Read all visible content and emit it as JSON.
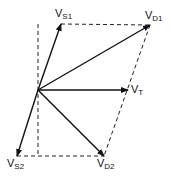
{
  "diagram": {
    "type": "phasor-vector-diagram",
    "origin": {
      "x": 38,
      "y": 90
    },
    "vectors": [
      {
        "id": "vs1",
        "label_main": "V",
        "label_sub": "S1",
        "to": {
          "x": 61,
          "y": 24
        }
      },
      {
        "id": "vd1",
        "label_main": "V",
        "label_sub": "D1",
        "to": {
          "x": 150,
          "y": 25
        }
      },
      {
        "id": "vt",
        "label_main": "V",
        "label_sub": "T",
        "to": {
          "x": 128,
          "y": 90
        }
      },
      {
        "id": "vs2",
        "label_main": "V",
        "label_sub": "S2",
        "to": {
          "x": 17,
          "y": 156
        }
      },
      {
        "id": "vd2",
        "label_main": "V",
        "label_sub": "D2",
        "to": {
          "x": 104,
          "y": 156
        }
      }
    ],
    "dashed_lines": [
      {
        "from": {
          "x": 61,
          "y": 24
        },
        "to": {
          "x": 150,
          "y": 25
        }
      },
      {
        "from": {
          "x": 150,
          "y": 25
        },
        "to": {
          "x": 104,
          "y": 156
        }
      },
      {
        "from": {
          "x": 17,
          "y": 156
        },
        "to": {
          "x": 104,
          "y": 156
        }
      },
      {
        "from": {
          "x": 38,
          "y": 24
        },
        "to": {
          "x": 38,
          "y": 156
        }
      }
    ],
    "colors": {
      "stroke": "#111111",
      "background": "#ffffff"
    }
  }
}
